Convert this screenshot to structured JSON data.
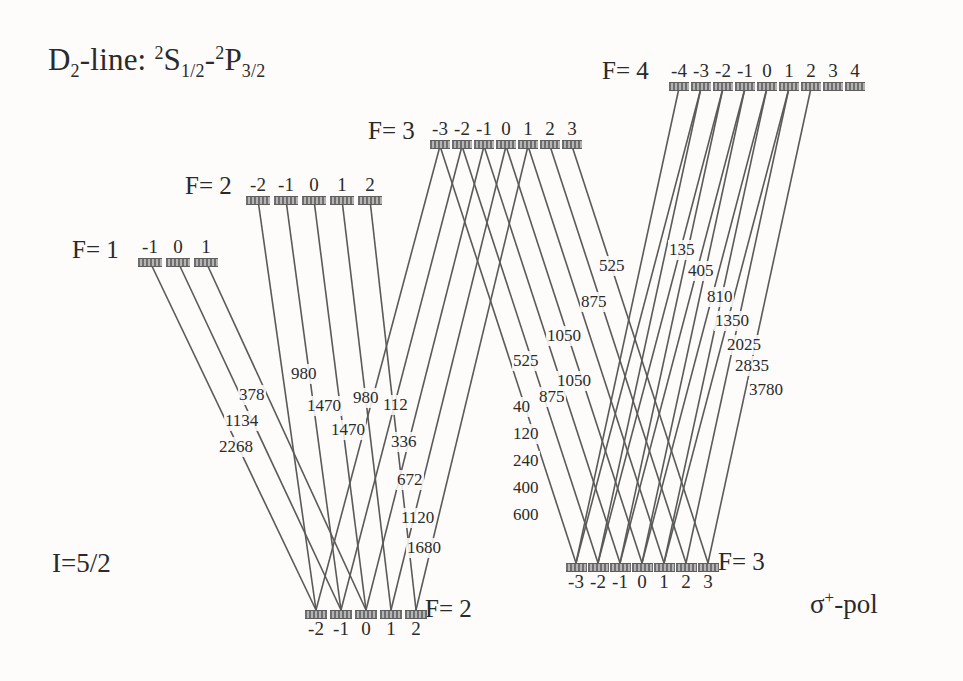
{
  "figure": {
    "title_prefix": "D",
    "title_sub": "2",
    "title_mid": "-line: ",
    "term_a_sup": "2",
    "term_a": "S",
    "term_a_sub": "1/2",
    "dash": "-",
    "term_b_sup": "2",
    "term_b": "P",
    "term_b_sub": "3/2",
    "nuclear_spin": "I=5/2",
    "polarization_sigma": "σ",
    "polarization_plus": "+",
    "polarization_rest": "-pol",
    "line_color": "#5a5a5a",
    "bar_color": "#8b8b8b",
    "background": "#fdfcfa"
  },
  "upper_levels": [
    {
      "name": "F= 1",
      "f_label": "F= 1",
      "label_x": 72,
      "label_y": 236,
      "bar_y": 258,
      "m_labels": [
        "-1",
        "0",
        "1"
      ],
      "sublevel_x": [
        150,
        178,
        206
      ],
      "bar_width": 24,
      "label_above": true
    },
    {
      "name": "F= 2",
      "f_label": "F= 2",
      "label_x": 185,
      "label_y": 172,
      "bar_y": 196,
      "m_labels": [
        "-2",
        "-1",
        "0",
        "1",
        "2"
      ],
      "sublevel_x": [
        258,
        286,
        314,
        342,
        370
      ],
      "bar_width": 24,
      "label_above": true
    },
    {
      "name": "F= 3",
      "f_label": "F= 3",
      "label_x": 368,
      "label_y": 117,
      "bar_y": 140,
      "m_labels": [
        "-3",
        "-2",
        "-1",
        "0",
        "1",
        "2",
        "3"
      ],
      "sublevel_x": [
        440,
        462,
        484,
        506,
        528,
        550,
        572
      ],
      "bar_width": 20,
      "label_above": true
    },
    {
      "name": "F= 4",
      "f_label": "F= 4",
      "label_x": 602,
      "label_y": 57,
      "bar_y": 82,
      "m_labels": [
        "-4",
        "-3",
        "-2",
        "-1",
        "0",
        "1",
        "2",
        "3",
        "4"
      ],
      "sublevel_x": [
        679,
        701,
        723,
        745,
        767,
        789,
        811,
        833,
        855
      ],
      "bar_width": 20,
      "label_above": true
    }
  ],
  "lower_levels": [
    {
      "name": "F= 2",
      "f_label": "F= 2",
      "label_x": 425,
      "label_y": 595,
      "bar_y": 610,
      "m_labels": [
        "-2",
        "-1",
        "0",
        "1",
        "2"
      ],
      "sublevel_x": [
        316,
        341,
        366,
        391,
        416
      ],
      "bar_width": 22,
      "label_below": true
    },
    {
      "name": "F= 3",
      "f_label": "F= 3",
      "label_x": 718,
      "label_y": 548,
      "bar_y": 563,
      "m_labels": [
        "-3",
        "-2",
        "-1",
        "0",
        "1",
        "2",
        "3"
      ],
      "sublevel_x": [
        576,
        598,
        620,
        642,
        664,
        686,
        708
      ],
      "bar_width": 21,
      "label_below": true
    }
  ],
  "transitions": [
    {
      "group": "F1-F2",
      "from_level": "upper-F1",
      "from_m": "-1",
      "to_level": "lower-F2",
      "to_m": "-2",
      "strength": "378",
      "x1": 150,
      "y1": 262,
      "x2": 316,
      "y2": 610,
      "lx": 238,
      "ly": 385
    },
    {
      "group": "F1-F2",
      "from_level": "upper-F1",
      "from_m": "0",
      "to_level": "lower-F2",
      "to_m": "-1",
      "strength": "1134",
      "x1": 178,
      "y1": 262,
      "x2": 341,
      "y2": 610,
      "lx": 224,
      "ly": 411
    },
    {
      "group": "F1-F2",
      "from_level": "upper-F1",
      "from_m": "1",
      "to_level": "lower-F2",
      "to_m": "0",
      "strength": "2268",
      "x1": 206,
      "y1": 262,
      "x2": 366,
      "y2": 610,
      "lx": 218,
      "ly": 437
    },
    {
      "group": "F2-F2",
      "from_level": "upper-F2",
      "from_m": "-2",
      "to_level": "lower-F2",
      "to_m": "-2",
      "strength": "980",
      "x1": 258,
      "y1": 200,
      "x2": 316,
      "y2": 610,
      "lx": 290,
      "ly": 364
    },
    {
      "group": "F2-F2",
      "from_level": "upper-F2",
      "from_m": "-1",
      "to_level": "lower-F2",
      "to_m": "-1",
      "strength": "1470",
      "x1": 286,
      "y1": 200,
      "x2": 341,
      "y2": 610,
      "lx": 306,
      "ly": 396
    },
    {
      "group": "F2-F2",
      "from_level": "upper-F2",
      "from_m": "0",
      "to_level": "lower-F2",
      "to_m": "0",
      "strength": "980",
      "x1": 314,
      "y1": 200,
      "x2": 366,
      "y2": 610,
      "lx": 352,
      "ly": 388
    },
    {
      "group": "F2-F2",
      "from_level": "upper-F2",
      "from_m": "1",
      "to_level": "lower-F2",
      "to_m": "1",
      "strength": "1470",
      "x1": 342,
      "y1": 200,
      "x2": 391,
      "y2": 610,
      "lx": 330,
      "ly": 420
    },
    {
      "group": "F2-F2",
      "from_level": "upper-F2",
      "from_m": "2",
      "to_level": "lower-F2",
      "to_m": "2",
      "strength": "",
      "x1": 370,
      "y1": 200,
      "x2": 416,
      "y2": 610,
      "lx": 0,
      "ly": 0
    },
    {
      "group": "F3-F2",
      "from_level": "upper-F3",
      "from_m": "-3",
      "to_level": "lower-F2",
      "to_m": "-2",
      "strength": "112",
      "x1": 440,
      "y1": 146,
      "x2": 316,
      "y2": 610,
      "lx": 382,
      "ly": 395
    },
    {
      "group": "F3-F2",
      "from_level": "upper-F3",
      "from_m": "-2",
      "to_level": "lower-F2",
      "to_m": "-1",
      "strength": "336",
      "x1": 462,
      "y1": 146,
      "x2": 341,
      "y2": 610,
      "lx": 390,
      "ly": 432
    },
    {
      "group": "F3-F2",
      "from_level": "upper-F3",
      "from_m": "-1",
      "to_level": "lower-F2",
      "to_m": "0",
      "strength": "672",
      "x1": 484,
      "y1": 146,
      "x2": 366,
      "y2": 610,
      "lx": 396,
      "ly": 470
    },
    {
      "group": "F3-F2",
      "from_level": "upper-F3",
      "from_m": "0",
      "to_level": "lower-F2",
      "to_m": "1",
      "strength": "1120",
      "x1": 506,
      "y1": 146,
      "x2": 391,
      "y2": 610,
      "lx": 400,
      "ly": 508
    },
    {
      "group": "F3-F2",
      "from_level": "upper-F3",
      "from_m": "1",
      "to_level": "lower-F2",
      "to_m": "2",
      "strength": "1680",
      "x1": 528,
      "y1": 146,
      "x2": 416,
      "y2": 610,
      "lx": 406,
      "ly": 538
    },
    {
      "group": "F3-F3",
      "from_level": "upper-F3",
      "from_m": "-3",
      "to_level": "lower-F3",
      "to_m": "-3",
      "strength": "525",
      "x1": 440,
      "y1": 146,
      "x2": 576,
      "y2": 563,
      "lx": 512,
      "ly": 351
    },
    {
      "group": "F3-F3",
      "from_level": "upper-F3",
      "from_m": "-2",
      "to_level": "lower-F3",
      "to_m": "-2",
      "strength": "875",
      "x1": 462,
      "y1": 146,
      "x2": 598,
      "y2": 563,
      "lx": 538,
      "ly": 387
    },
    {
      "group": "F3-F3",
      "from_level": "upper-F3",
      "from_m": "-1",
      "to_level": "lower-F3",
      "to_m": "-1",
      "strength": "1050",
      "x1": 484,
      "y1": 146,
      "x2": 620,
      "y2": 563,
      "lx": 556,
      "ly": 371
    },
    {
      "group": "F3-F3",
      "from_level": "upper-F3",
      "from_m": "0",
      "to_level": "lower-F3",
      "to_m": "0",
      "strength": "1050",
      "x1": 506,
      "y1": 146,
      "x2": 642,
      "y2": 563,
      "lx": 546,
      "ly": 326
    },
    {
      "group": "F3-F3",
      "from_level": "upper-F3",
      "from_m": "1",
      "to_level": "lower-F3",
      "to_m": "1",
      "strength": "875",
      "x1": 528,
      "y1": 146,
      "x2": 664,
      "y2": 563,
      "lx": 580,
      "ly": 292
    },
    {
      "group": "F3-F3",
      "from_level": "upper-F3",
      "from_m": "2",
      "to_level": "lower-F3",
      "to_m": "2",
      "strength": "525",
      "x1": 550,
      "y1": 146,
      "x2": 686,
      "y2": 563,
      "lx": 598,
      "ly": 256
    },
    {
      "group": "F3-F3",
      "from_level": "upper-F3",
      "from_m": "3",
      "to_level": "lower-F3",
      "to_m": "3",
      "strength": "",
      "x1": 572,
      "y1": 146,
      "x2": 708,
      "y2": 563,
      "lx": 0,
      "ly": 0
    },
    {
      "group": "F4-F3",
      "from_level": "upper-F4",
      "from_m": "-3",
      "to_level": "lower-F3",
      "to_m": "-3",
      "strength": "40",
      "x1": 701,
      "y1": 88,
      "x2": 576,
      "y2": 563,
      "lx": 512,
      "ly": 397
    },
    {
      "group": "F4-F3",
      "from_level": "upper-F4",
      "from_m": "-2",
      "to_level": "lower-F3",
      "to_m": "-2",
      "strength": "120",
      "x1": 723,
      "y1": 88,
      "x2": 598,
      "y2": 563,
      "lx": 512,
      "ly": 424
    },
    {
      "group": "F4-F3",
      "from_level": "upper-F4",
      "from_m": "-1",
      "to_level": "lower-F3",
      "to_m": "-1",
      "strength": "240",
      "x1": 745,
      "y1": 88,
      "x2": 620,
      "y2": 563,
      "lx": 512,
      "ly": 451
    },
    {
      "group": "F4-F3",
      "from_level": "upper-F4",
      "from_m": "0",
      "to_level": "lower-F3",
      "to_m": "0",
      "strength": "400",
      "x1": 767,
      "y1": 88,
      "x2": 642,
      "y2": 563,
      "lx": 512,
      "ly": 478
    },
    {
      "group": "F4-F3",
      "from_level": "upper-F4",
      "from_m": "1",
      "to_level": "lower-F3",
      "to_m": "1",
      "strength": "600",
      "x1": 789,
      "y1": 88,
      "x2": 664,
      "y2": 563,
      "lx": 512,
      "ly": 505
    },
    {
      "group": "F4-right",
      "from_level": "upper-F4",
      "from_m": "-4",
      "to_level": "lower-F3",
      "to_m": "-3",
      "strength": "135",
      "x1": 679,
      "y1": 88,
      "x2": 576,
      "y2": 563,
      "lx": 668,
      "ly": 240
    },
    {
      "group": "F4-right",
      "from_level": "upper-F4",
      "from_m": "-3",
      "to_level": "lower-F3",
      "to_m": "-2",
      "strength": "405",
      "x1": 701,
      "y1": 88,
      "x2": 598,
      "y2": 563,
      "lx": 687,
      "ly": 261
    },
    {
      "group": "F4-right",
      "from_level": "upper-F4",
      "from_m": "-2",
      "to_level": "lower-F3",
      "to_m": "-1",
      "strength": "810",
      "x1": 723,
      "y1": 88,
      "x2": 620,
      "y2": 563,
      "lx": 706,
      "ly": 287
    },
    {
      "group": "F4-right",
      "from_level": "upper-F4",
      "from_m": "-1",
      "to_level": "lower-F3",
      "to_m": "0",
      "strength": "1350",
      "x1": 745,
      "y1": 88,
      "x2": 642,
      "y2": 563,
      "lx": 714,
      "ly": 311
    },
    {
      "group": "F4-right",
      "from_level": "upper-F4",
      "from_m": "0",
      "to_level": "lower-F3",
      "to_m": "1",
      "strength": "2025",
      "x1": 767,
      "y1": 88,
      "x2": 664,
      "y2": 563,
      "lx": 726,
      "ly": 335
    },
    {
      "group": "F4-right",
      "from_level": "upper-F4",
      "from_m": "1",
      "to_level": "lower-F3",
      "to_m": "2",
      "strength": "2835",
      "x1": 789,
      "y1": 88,
      "x2": 686,
      "y2": 563,
      "lx": 734,
      "ly": 356
    },
    {
      "group": "F4-right",
      "from_level": "upper-F4",
      "from_m": "2",
      "to_level": "lower-F3",
      "to_m": "3",
      "strength": "3780",
      "x1": 811,
      "y1": 88,
      "x2": 708,
      "y2": 563,
      "lx": 748,
      "ly": 380
    }
  ]
}
